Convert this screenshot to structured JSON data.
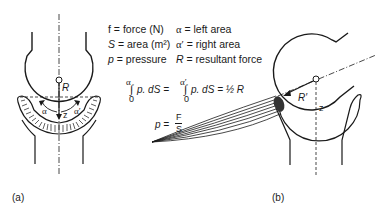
{
  "legend": {
    "rows": [
      {
        "left_sym": "f",
        "left_def": "= force (N)",
        "right_sym": "α",
        "right_def": "= left area"
      },
      {
        "left_sym": "S",
        "left_def": "= area (m²)",
        "right_sym": "α′",
        "right_def": "= right area"
      },
      {
        "left_sym": "p",
        "left_def": "= pressure",
        "right_sym": "R",
        "right_def": "= resultant force"
      }
    ]
  },
  "equations": {
    "integral_1_upper": "α",
    "integral_1_lower": "0",
    "integral_1_body": "p. dS =",
    "integral_2_upper": "α′",
    "integral_2_lower": "0",
    "integral_2_body": "p. dS = ½ R",
    "pressure_lhs": "p =",
    "pressure_num": "F",
    "pressure_den": "S"
  },
  "diagram_a": {
    "caption": "(a)",
    "label_R": "R",
    "label_z": "z",
    "label_alpha": "α",
    "label_alpha_prime": "α′"
  },
  "diagram_b": {
    "caption": "(b)",
    "label_R": "R′",
    "label_z": "z"
  },
  "colors": {
    "ink": "#1a1a1a",
    "background": "#ffffff"
  }
}
